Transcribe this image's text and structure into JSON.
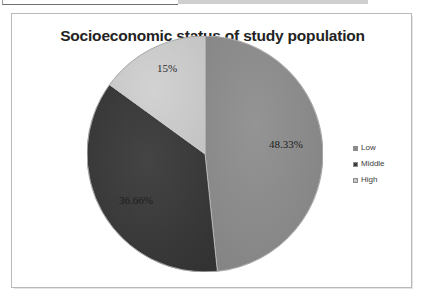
{
  "chart_data": {
    "type": "pie",
    "title": "Socioeconomic status of study population",
    "categories": [
      "Low",
      "Middle",
      "High"
    ],
    "values": [
      48.33,
      36.66,
      15
    ],
    "labels": [
      "48.33%",
      "36.66%",
      "15%"
    ],
    "colors": [
      "#8a8a8a",
      "#3a3a3a",
      "#c8c8c8"
    ],
    "legend_position": "right",
    "start_angle_deg": 0,
    "direction": "clockwise",
    "units": "percent",
    "xlabel": "",
    "ylabel": ""
  },
  "frame": {
    "border_color": "#b9b9b9",
    "background": "#ffffff"
  },
  "legend": {
    "items": [
      {
        "label": "Low",
        "color": "#8a8a8a"
      },
      {
        "label": "Middle",
        "color": "#3a3a3a"
      },
      {
        "label": "High",
        "color": "#c8c8c8"
      }
    ]
  }
}
